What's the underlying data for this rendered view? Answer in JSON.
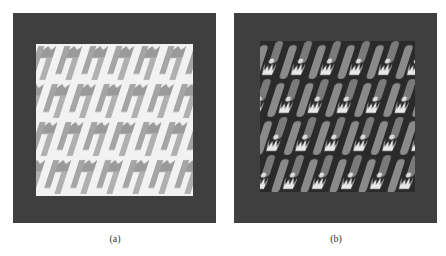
{
  "figure": {
    "panels": [
      {
        "id": "a",
        "caption": "(a)",
        "description": "Fabric weave texture, light background with grey slanted pattern"
      },
      {
        "id": "b",
        "caption": "(b)",
        "description": "Rendered 3D weave texture with grey slanted threads and white highlights on dark background"
      }
    ],
    "colors": {
      "frame": "#3f3f3f",
      "panel_a_bg": "#f2f2f2",
      "panel_a_pattern": "#9a9a9a",
      "panel_b_bg": "#2a2a2a",
      "panel_b_thread": "#8a8a8a",
      "panel_b_highlight": "#e8e8e8"
    }
  }
}
